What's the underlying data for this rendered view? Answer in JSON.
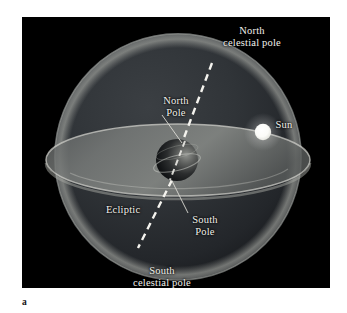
{
  "figure": {
    "caption_letter": "a",
    "panel_background": "#000000",
    "page_background": "#ffffff"
  },
  "labels": {
    "north_celestial_pole": {
      "line1": "North",
      "line2": "celestial pole"
    },
    "north_pole": {
      "line1": "North",
      "line2": "Pole"
    },
    "sun": {
      "line1": "Sun"
    },
    "ecliptic": {
      "line1": "Ecliptic"
    },
    "south_pole": {
      "line1": "South",
      "line2": "Pole"
    },
    "south_celestial_pole": {
      "line1": "South",
      "line2": "celestial pole"
    }
  },
  "colors": {
    "label_text": "#f2f1ec",
    "celestial_sphere_fill": "#2a2d30",
    "celestial_sphere_rim": "#9a9a96",
    "ecliptic_disc": "#6e7170",
    "ecliptic_rim": "#b9bab4",
    "earth_dark": "#101214",
    "earth_lit": "#8d8f8c",
    "sun_disc": "#ffffff",
    "axis_dash": "#f4f3ee",
    "leader_line": "#dcdbd5"
  },
  "elements": {
    "celestial_sphere": {
      "cx": 156,
      "cy": 140,
      "r": 124
    },
    "ecliptic_disc": {
      "cx": 156,
      "cy": 143,
      "rx": 132,
      "ry": 36
    },
    "earth": {
      "cx": 155,
      "cy": 143,
      "r": 21
    },
    "sun": {
      "cx": 241,
      "cy": 115,
      "r": 8
    },
    "rotation_axis": {
      "x1": 190,
      "y1": 46,
      "x2": 116,
      "y2": 228
    }
  }
}
